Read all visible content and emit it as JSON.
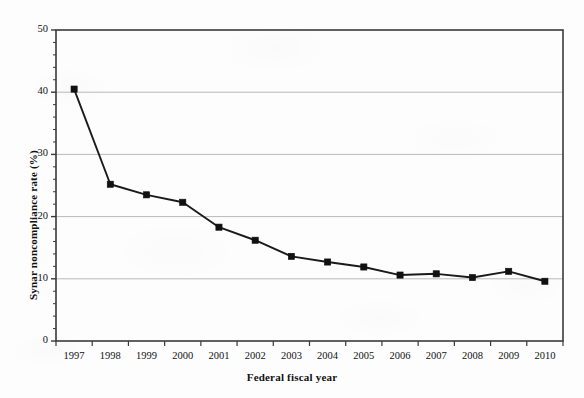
{
  "chart_data": {
    "type": "line",
    "title": "",
    "xlabel": "Federal fiscal year",
    "ylabel": "Synar noncompliance rate (%)",
    "categories": [
      "1997",
      "1998",
      "1999",
      "2000",
      "2001",
      "2002",
      "2003",
      "2004",
      "2005",
      "2006",
      "2007",
      "2008",
      "2009",
      "2010"
    ],
    "values": [
      40.5,
      25.2,
      23.5,
      22.3,
      18.3,
      16.2,
      13.6,
      12.7,
      11.9,
      10.6,
      10.8,
      10.2,
      11.2,
      9.6
    ],
    "series": [
      {
        "name": "Synar noncompliance rate",
        "values": [
          40.5,
          25.2,
          23.5,
          22.3,
          18.3,
          16.2,
          13.6,
          12.7,
          11.9,
          10.6,
          10.8,
          10.2,
          11.2,
          9.6
        ]
      }
    ],
    "ylim": [
      0,
      50
    ],
    "ytick_labels": [
      "0",
      "10",
      "20",
      "30",
      "40",
      "50"
    ],
    "ytick_values": [
      0,
      10,
      20,
      30,
      40,
      50
    ],
    "yminor_step": 2,
    "xtick_labels": [
      "1997",
      "1998",
      "1999",
      "2000",
      "2001",
      "2002",
      "2003",
      "2004",
      "2005",
      "2006",
      "2007",
      "2008",
      "2009",
      "2010"
    ],
    "grid": "horizontal",
    "legend": "none",
    "marker": "filled-square",
    "line_color": "#1a1a1a",
    "marker_color": "#111111",
    "grid_color": "#b9b9b9",
    "axis_color": "#3a3a3a",
    "background_color": "#fdfdfd"
  }
}
